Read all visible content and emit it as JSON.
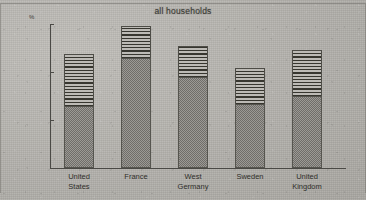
{
  "chart_data": {
    "type": "bar",
    "stacked": true,
    "title": "all households",
    "xlabel": "",
    "ylabel": "%",
    "ylim": [
      0,
      60
    ],
    "yticks": [
      0,
      20,
      40,
      60
    ],
    "grid": false,
    "legend": "none",
    "categories": [
      "United States",
      "France",
      "West Germany",
      "Sweden",
      "United Kingdom"
    ],
    "series": [
      {
        "name": "lower-segment",
        "pattern": "stipple",
        "values": [
          26,
          46,
          38,
          26.5,
          30
        ]
      },
      {
        "name": "upper-segment",
        "pattern": "horizontal-hatch",
        "values": [
          21.5,
          13,
          13,
          15,
          19
        ]
      }
    ],
    "totals": [
      47.5,
      59,
      51,
      41.5,
      49
    ]
  },
  "chart": {
    "title": "all households",
    "axis": {
      "y_unit_label": "%",
      "y_ticks": [
        "0",
        "20",
        "40",
        "60"
      ]
    },
    "bars": [
      {
        "label_line1": "United",
        "label_line2": "States",
        "lower": 26,
        "upper": 21.5
      },
      {
        "label_line1": "France",
        "label_line2": "",
        "lower": 46,
        "upper": 13
      },
      {
        "label_line1": "West",
        "label_line2": "Germany",
        "lower": 38,
        "upper": 13
      },
      {
        "label_line1": "Sweden",
        "label_line2": "",
        "lower": 26.5,
        "upper": 15
      },
      {
        "label_line1": "United",
        "label_line2": "Kingdom",
        "lower": 30,
        "upper": 19
      }
    ]
  },
  "colors": {
    "paper": "#b4b2ad",
    "ink": "#3a3934",
    "stipple_fill": "#8e8c87",
    "hatch_line": "#37362f"
  }
}
